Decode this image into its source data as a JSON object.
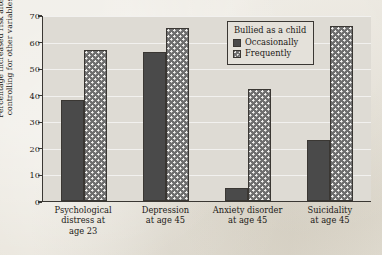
{
  "chart_data": {
    "type": "bar",
    "title": "",
    "xlabel": "",
    "ylabel": "Percentage increased risk after controlling for other variables",
    "ylabel_line1": "Percentage increased risk after",
    "ylabel_line2": "controlling for other variables",
    "ylim": [
      0,
      70
    ],
    "yticks": [
      0,
      10,
      20,
      30,
      40,
      50,
      60,
      70
    ],
    "grid": true,
    "legend_position": "top-right-inside",
    "legend_title": "Bullied as a child",
    "categories": [
      "Psychological distress at age 23",
      "Depression at age 45",
      "Anxiety disorder at age 45",
      "Suicidality at age 45"
    ],
    "category_lines": [
      [
        "Psychological",
        "distress at",
        "age 23"
      ],
      [
        "Depression",
        "at age 45"
      ],
      [
        "Anxiety disorder",
        "at age 45"
      ],
      [
        "Suicidality",
        "at age 45"
      ]
    ],
    "series": [
      {
        "name": "Occasionally",
        "color": "#4a4a4a",
        "fill": "solid",
        "values": [
          38,
          56,
          5,
          23
        ]
      },
      {
        "name": "Frequently",
        "color": "#6e6e6e",
        "fill": "dotted-checker",
        "values": [
          57,
          65,
          42,
          66
        ]
      }
    ]
  },
  "style": {
    "plot_background": "#dedbd4",
    "page_background": "#e8e4da",
    "axis_color": "#3a3733",
    "text_color": "#1c1a17",
    "gridline_color": "#ffffff"
  }
}
